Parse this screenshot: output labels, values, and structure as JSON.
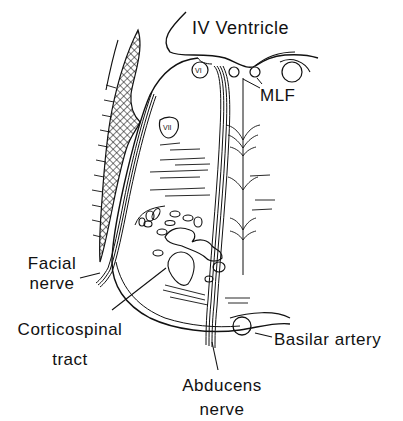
{
  "figure": {
    "type": "anatomical cross-section line drawing",
    "colors": {
      "ink": "#111111",
      "background": "#ffffff"
    }
  },
  "labels": {
    "iv_ventricle": "IV Ventricle",
    "mlf": "MLF",
    "facial_nerve_line1": "Facial",
    "facial_nerve_line2": "nerve",
    "corticospinal_line1": "Corticospinal",
    "corticospinal_line2": "tract",
    "basilar_artery": "Basilar artery",
    "abducens_line1": "Abducens",
    "abducens_line2": "nerve",
    "nucleus_vi": "VI",
    "nucleus_vii": "VII"
  }
}
